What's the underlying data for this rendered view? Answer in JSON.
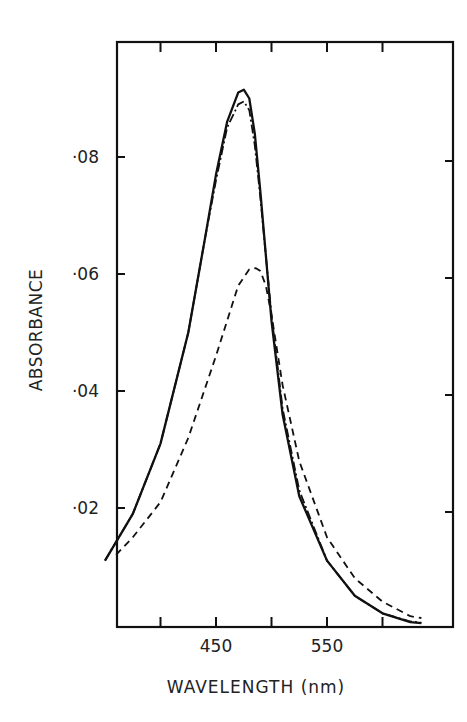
{
  "chart_data": {
    "type": "line",
    "title": "",
    "xlabel": "WAVELENGTH (nm)",
    "ylabel": "ABSORBANCE",
    "xlim": [
      350,
      650
    ],
    "ylim": [
      0,
      0.093
    ],
    "x_tick_labels": [
      "450",
      "550"
    ],
    "x_tick_positions": [
      400,
      450,
      500,
      550,
      600
    ],
    "y_tick_labels": [
      "·02",
      "·04",
      "·06",
      "·08"
    ],
    "y_tick_values": [
      0.02,
      0.04,
      0.06,
      0.08
    ],
    "grid": false,
    "legend": null,
    "series": [
      {
        "name": "solid",
        "style": "solid",
        "x": [
          350,
          375,
          400,
          425,
          440,
          450,
          460,
          470,
          475,
          480,
          485,
          490,
          500,
          510,
          525,
          550,
          575,
          600,
          625,
          635
        ],
        "y": [
          0.011,
          0.019,
          0.031,
          0.05,
          0.066,
          0.077,
          0.086,
          0.091,
          0.0915,
          0.09,
          0.084,
          0.074,
          0.052,
          0.036,
          0.022,
          0.011,
          0.005,
          0.002,
          0.0005,
          0.0003
        ]
      },
      {
        "name": "dash-dot",
        "style": "dashdot",
        "x": [
          350,
          375,
          400,
          425,
          440,
          450,
          460,
          470,
          475,
          480,
          485,
          490,
          500,
          510,
          525,
          550,
          575,
          600,
          625,
          635
        ],
        "y": [
          0.011,
          0.019,
          0.031,
          0.05,
          0.066,
          0.076,
          0.085,
          0.089,
          0.0895,
          0.088,
          0.082,
          0.073,
          0.053,
          0.037,
          0.023,
          0.011,
          0.005,
          0.002,
          0.0006,
          0.0004
        ]
      },
      {
        "name": "dashed",
        "style": "dashed",
        "x": [
          360,
          375,
          400,
          425,
          450,
          460,
          470,
          480,
          486,
          490,
          495,
          500,
          510,
          525,
          550,
          575,
          600,
          625,
          635
        ],
        "y": [
          0.012,
          0.015,
          0.021,
          0.032,
          0.046,
          0.052,
          0.058,
          0.0608,
          0.061,
          0.0605,
          0.058,
          0.053,
          0.041,
          0.028,
          0.015,
          0.008,
          0.004,
          0.0015,
          0.0012
        ]
      }
    ]
  }
}
